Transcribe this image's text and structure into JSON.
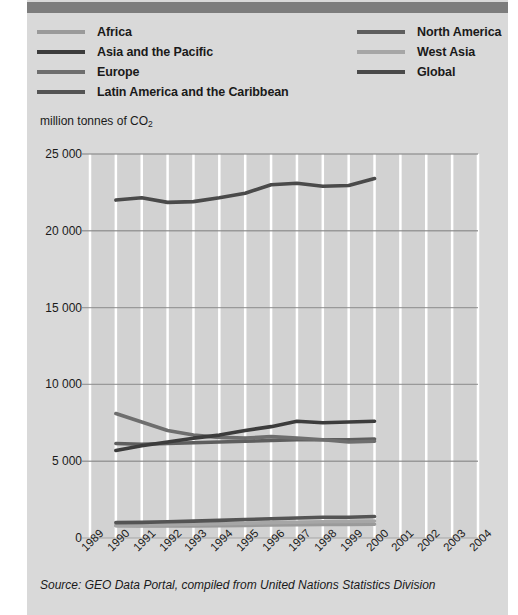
{
  "colors": {
    "panel_bg": "#d9d9d9",
    "top_bar": "#7d7d7d",
    "plot_bg": "#d2d2d2",
    "grid_h": "#8c8c8c",
    "grid_v": "#ffffff",
    "text": "#1a1a1a"
  },
  "top_bar": {
    "label": "decorative-header-bar"
  },
  "legend": {
    "left_column": [
      {
        "label": "Africa",
        "color": "#9a9a9a"
      },
      {
        "label": "Asia and the Pacific",
        "color": "#3c3c3c"
      },
      {
        "label": "Europe",
        "color": "#6e6e6e"
      },
      {
        "label": "Latin America and the Caribbean",
        "color": "#545454"
      }
    ],
    "right_column": [
      {
        "label": "North America",
        "color": "#5e5e5e"
      },
      {
        "label": "West Asia",
        "color": "#a6a6a6"
      },
      {
        "label": "Global",
        "color": "#4a4a4a"
      }
    ]
  },
  "axis_title": {
    "main": "million tonnes of CO",
    "sub": "2"
  },
  "source": {
    "text": "Source: GEO Data Portal, compiled from United Nations Statistics Division"
  },
  "chart_data": {
    "type": "line",
    "title": "",
    "xlabel": "",
    "ylabel": "million tonnes of CO2",
    "x": [
      1989,
      1990,
      1991,
      1992,
      1993,
      1994,
      1995,
      1996,
      1997,
      1998,
      1999,
      2000,
      2001,
      2002,
      2003,
      2004
    ],
    "xtick_labels": [
      "1989",
      "1990",
      "1991",
      "1992",
      "1993",
      "1994",
      "1995",
      "1996",
      "1997",
      "1998",
      "1999",
      "2000",
      "2001",
      "2002",
      "2003",
      "2004"
    ],
    "ylim": [
      0,
      25000
    ],
    "ytick_values": [
      0,
      5000,
      10000,
      15000,
      20000,
      25000
    ],
    "ytick_labels": [
      "0",
      "5 000",
      "10 000",
      "15 000",
      "20 000",
      "25 000"
    ],
    "grid": {
      "horizontal": true,
      "vertical": true
    },
    "legend_position": "above-plot",
    "series": [
      {
        "name": "Global",
        "color": "#4a4a4a",
        "x": [
          1990,
          1991,
          1992,
          1993,
          1994,
          1995,
          1996,
          1997,
          1998,
          1999,
          2000
        ],
        "values": [
          22000,
          22150,
          21850,
          21900,
          22150,
          22450,
          23000,
          23100,
          22900,
          22950,
          23400
        ]
      },
      {
        "name": "Asia and the Pacific",
        "color": "#3c3c3c",
        "x": [
          1990,
          1991,
          1992,
          1993,
          1994,
          1995,
          1996,
          1997,
          1998,
          1999,
          2000
        ],
        "values": [
          5700,
          6000,
          6250,
          6500,
          6700,
          7000,
          7250,
          7600,
          7500,
          7550,
          7600
        ]
      },
      {
        "name": "Europe",
        "color": "#6e6e6e",
        "x": [
          1990,
          1991,
          1992,
          1993,
          1994,
          1995,
          1996,
          1997,
          1998,
          1999,
          2000
        ],
        "values": [
          8100,
          7550,
          7000,
          6700,
          6550,
          6500,
          6600,
          6500,
          6400,
          6250,
          6300
        ]
      },
      {
        "name": "North America",
        "color": "#5e5e5e",
        "x": [
          1990,
          1991,
          1992,
          1993,
          1994,
          1995,
          1996,
          1997,
          1998,
          1999,
          2000
        ],
        "values": [
          6150,
          6100,
          6150,
          6200,
          6250,
          6300,
          6350,
          6400,
          6400,
          6400,
          6450
        ]
      },
      {
        "name": "Latin America and the Caribbean",
        "color": "#545454",
        "x": [
          1990,
          1991,
          1992,
          1993,
          1994,
          1995,
          1996,
          1997,
          1998,
          1999,
          2000
        ],
        "values": [
          1000,
          1020,
          1060,
          1100,
          1150,
          1200,
          1250,
          1300,
          1350,
          1350,
          1400
        ]
      },
      {
        "name": "Africa",
        "color": "#9a9a9a",
        "x": [
          1990,
          1991,
          1992,
          1993,
          1994,
          1995,
          1996,
          1997,
          1998,
          1999,
          2000
        ],
        "values": [
          800,
          790,
          780,
          790,
          800,
          820,
          850,
          870,
          880,
          890,
          900
        ]
      },
      {
        "name": "West Asia",
        "color": "#a6a6a6",
        "x": [
          1990,
          1991,
          1992,
          1993,
          1994,
          1995,
          1996,
          1997,
          1998,
          1999,
          2000
        ],
        "values": [
          820,
          840,
          870,
          900,
          930,
          960,
          1000,
          1030,
          1060,
          1080,
          1100
        ]
      }
    ]
  }
}
